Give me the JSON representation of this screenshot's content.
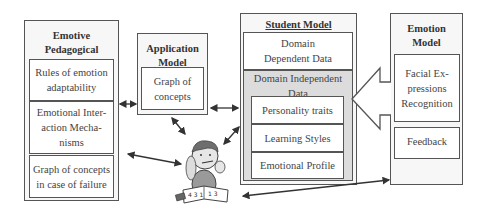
{
  "emotive_pedagogical_model": {
    "title": "Emotive Pedagogical Model",
    "components": [
      "Rules of emotion adaptability",
      "Emotional Inter-action Mecha-nisms",
      "Graph of concepts in case of failure"
    ]
  },
  "application_model": {
    "title": "Application Model",
    "components": [
      "Graph of concepts"
    ]
  },
  "student_model": {
    "title": "Student Model",
    "domain_dependent": "Domain Dependent Data",
    "domain_independent": {
      "label": "Domain Independent Data",
      "components": [
        "Personality traits",
        "Learning Styles",
        "Emotional Profile"
      ]
    }
  },
  "emotion_model": {
    "title": "Emotion Model",
    "components": [
      "Facial Ex-pressions Recognition",
      "Feedback"
    ]
  },
  "center_figure": "student-studying-illustration",
  "colors": {
    "border": "#555555",
    "shaded": "#dcdcdc",
    "box_bg": "#f7f7f7"
  }
}
